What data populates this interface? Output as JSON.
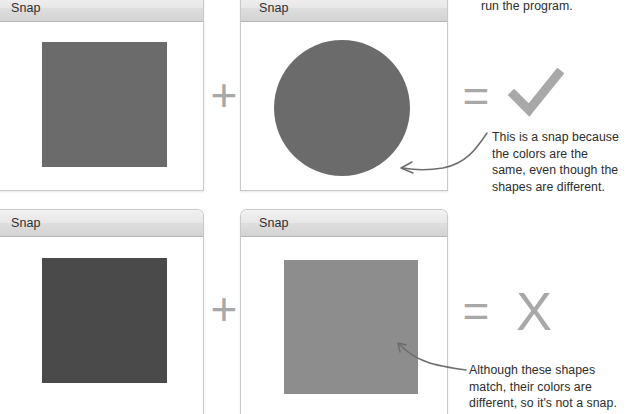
{
  "page": {
    "background": "#ffffff",
    "text_color": "#2d2d2d",
    "glyph_color": "#a8a8a8"
  },
  "windows": [
    {
      "id": "snap-window-top-left",
      "title": "Snap",
      "shape": {
        "kind": "square",
        "color": "#6b6b6b"
      }
    },
    {
      "id": "snap-window-top-right",
      "title": "Snap",
      "shape": {
        "kind": "circle",
        "color": "#6b6b6b"
      }
    },
    {
      "id": "snap-window-bottom-left",
      "title": "Snap",
      "shape": {
        "kind": "square",
        "color": "#4a4a4a"
      }
    },
    {
      "id": "snap-window-bottom-right",
      "title": "Snap",
      "shape": {
        "kind": "square",
        "color": "#8d8d8d"
      }
    }
  ],
  "operators": {
    "top_plus": "+",
    "top_equals": "=",
    "bottom_plus": "+",
    "bottom_equals": "="
  },
  "results": {
    "top": {
      "symbol": "check",
      "glyph": "✓",
      "meaning": "match"
    },
    "bottom": {
      "symbol": "cross",
      "glyph": "X",
      "meaning": "no match"
    }
  },
  "annotations": {
    "top_partial_text": "run the program.",
    "top_callout": "This is a snap because the colors are the same, even though the shapes are different.",
    "bottom_callout": "Although these shapes match, their colors are different, so it's not a snap."
  }
}
